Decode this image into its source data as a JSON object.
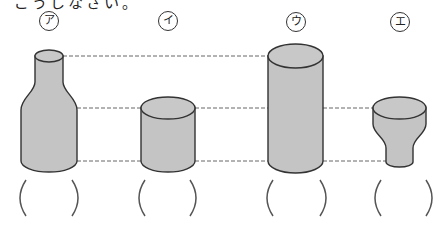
{
  "instruction_fragment": "ごうしなさい。",
  "colors": {
    "fill": "#c4c4c4",
    "top_fill": "#c8c8c8",
    "outline": "#333333",
    "dash": "#666666",
    "paren": "#555555"
  },
  "containers": [
    {
      "id": "a",
      "label": "ア",
      "shape": "bottle",
      "answer": ""
    },
    {
      "id": "i",
      "label": "イ",
      "shape": "short-cylinder",
      "answer": ""
    },
    {
      "id": "u",
      "label": "ウ",
      "shape": "tall-cylinder",
      "answer": ""
    },
    {
      "id": "e",
      "label": "エ",
      "shape": "funnel",
      "answer": ""
    }
  ],
  "guide_lines": [
    {
      "name": "top-level",
      "y": 56
    },
    {
      "name": "middle-level",
      "y": 108
    },
    {
      "name": "bottom-level",
      "y": 161
    }
  ]
}
